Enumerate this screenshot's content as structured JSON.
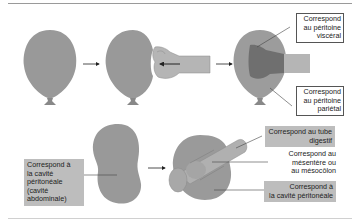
{
  "colors": {
    "balloon": "#999999",
    "balloon_dark": "#7a7a7a",
    "hand": "#b3b3b3",
    "hand_inside": "#6f6f6f",
    "label_shade": "#bdbdbd",
    "text": "#222222"
  },
  "top_row": {
    "steps": [
      "balloon",
      "fist-pushing-balloon",
      "fist-inside-balloon"
    ],
    "labels": {
      "visceral": {
        "lines": [
          "Correspond",
          "au péritoine",
          "viscéral"
        ]
      },
      "parietal": {
        "lines": [
          "Correspond",
          "au péritoine",
          "pariétal"
        ]
      }
    }
  },
  "bottom_row": {
    "steps": [
      "peritoneal-cavity-shape",
      "cavity-with-digestive-tube"
    ],
    "labels": {
      "cavity": {
        "lines": [
          "Correspond à",
          "la cavité",
          "péritonéale",
          "(cavité",
          "abdominale)"
        ]
      },
      "tube": {
        "lines": [
          "Correspond au tube",
          "digestif"
        ]
      },
      "mesentery": {
        "lines": [
          "Correspond au",
          "mésentère ou",
          "au mésocôlon"
        ]
      },
      "peritoneal_cavity": {
        "lines": [
          "Correspond à",
          "la cavité péritonéale"
        ]
      }
    }
  }
}
